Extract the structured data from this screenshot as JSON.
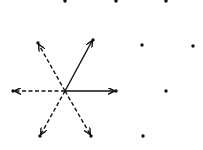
{
  "diagram": {
    "title": "",
    "center": [
      65,
      91
    ],
    "ink_color": "#111111",
    "background": "#ffffff",
    "arrows": [
      {
        "id": "to-top-right",
        "to": [
          92,
          41
        ],
        "style": "solid"
      },
      {
        "id": "to-right",
        "to": [
          114,
          91
        ],
        "style": "solid"
      },
      {
        "id": "to-top-left",
        "to": [
          39,
          45
        ],
        "style": "dashed"
      },
      {
        "id": "to-left",
        "to": [
          15,
          91
        ],
        "style": "dashed"
      },
      {
        "id": "to-bottom-left",
        "to": [
          41,
          134
        ],
        "style": "dashed"
      },
      {
        "id": "to-bottom-right",
        "to": [
          90,
          134
        ],
        "style": "dashed"
      }
    ],
    "dots": [
      [
        65,
        1
      ],
      [
        116,
        1
      ],
      [
        166,
        1
      ],
      [
        38,
        43
      ],
      [
        93,
        40
      ],
      [
        142,
        45
      ],
      [
        193,
        46
      ],
      [
        13,
        91
      ],
      [
        116,
        91
      ],
      [
        166,
        91
      ],
      [
        40,
        136
      ],
      [
        91,
        136
      ],
      [
        143,
        136
      ]
    ]
  }
}
